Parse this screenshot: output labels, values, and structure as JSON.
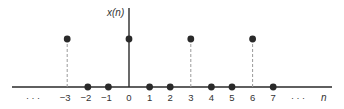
{
  "figure": {
    "y_axis_label": "x(n)",
    "x_axis_label": "n",
    "left_ellipsis": "· · ·",
    "right_ellipsis": "· · ·",
    "colors": {
      "ink": "#2a2a2a",
      "dash": "#9a9a9a",
      "text": "#333333"
    }
  },
  "chart_data": {
    "type": "stem",
    "title": "",
    "xlabel": "n",
    "ylabel": "x(n)",
    "x": [
      -3,
      -2,
      -1,
      0,
      1,
      2,
      3,
      4,
      5,
      6,
      7
    ],
    "values": [
      1,
      0,
      0,
      1,
      0,
      0,
      1,
      0,
      0,
      1,
      0
    ],
    "tick_labels": [
      "−3",
      "−2",
      "−1",
      "0",
      "1",
      "2",
      "3",
      "4",
      "5",
      "6",
      "7"
    ],
    "grid": false,
    "legend": null
  }
}
